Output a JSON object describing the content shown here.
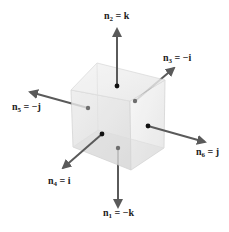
{
  "diagram": {
    "type": "cube-face-normals",
    "colors": {
      "arrow": "#5a5a5a",
      "dot_front": "#111111",
      "dot_hidden": "#6e6e6e",
      "cube_top": "#eeeeee",
      "cube_left": "#e4e4e4",
      "cube_right": "#f3f3f3",
      "cube_edge": "#cfcfcf"
    },
    "labels": [
      {
        "id": "n2",
        "name": "n",
        "sub": "2",
        "rhs": "= k"
      },
      {
        "id": "n3",
        "name": "n",
        "sub": "3",
        "rhs": "= −i"
      },
      {
        "id": "n5",
        "name": "n",
        "sub": "5",
        "rhs": "= −j"
      },
      {
        "id": "n6",
        "name": "n",
        "sub": "6",
        "rhs": "= j"
      },
      {
        "id": "n4",
        "name": "n",
        "sub": "4",
        "rhs": "= i"
      },
      {
        "id": "n1",
        "name": "n",
        "sub": "1",
        "rhs": "= −k"
      }
    ]
  }
}
